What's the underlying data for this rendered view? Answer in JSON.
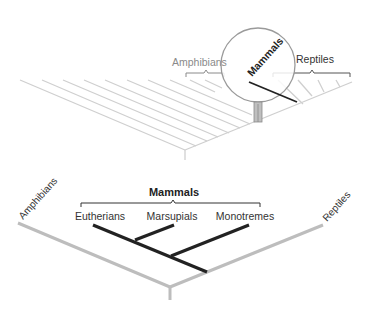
{
  "colors": {
    "light_branch": "#c8c8c8",
    "gray_branch": "#bdbdbd",
    "dark_branch": "#222222",
    "label_gray": "#8a8a8a",
    "label_dark": "#2a2a2a",
    "magnifier_outline": "#9a9a9a"
  },
  "top_panel": {
    "labels": {
      "amphibians": "Amphibians",
      "mammals": "Mammals",
      "reptiles": "Reptiles"
    },
    "icon": "magnifying-glass-icon"
  },
  "bottom_panel": {
    "clade_title": "Mammals",
    "outgroups": {
      "left": "Amphibians",
      "right": "Reptiles"
    },
    "taxa": [
      {
        "label": "Eutherians"
      },
      {
        "label": "Marsupials"
      },
      {
        "label": "Monotremes"
      }
    ]
  }
}
